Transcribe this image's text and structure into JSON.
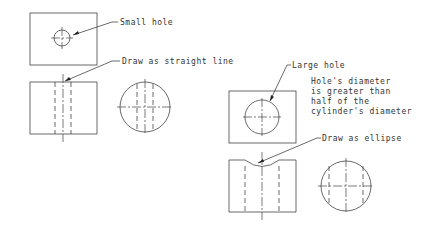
{
  "diagram": {
    "type": "orthographic projection drawing",
    "left_example": {
      "labels": {
        "small_hole": "Small hole",
        "straight_line": "Draw as straight line"
      }
    },
    "right_example": {
      "labels": {
        "large_hole": "Large hole",
        "note_line1": "Hole's diameter",
        "note_line2": "is greater than",
        "note_line3": "half of the",
        "note_line4": "cylinder's diameter",
        "ellipse": "Draw as ellipse"
      }
    }
  }
}
